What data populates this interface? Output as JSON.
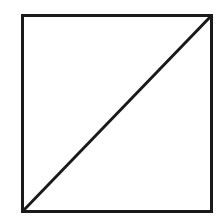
{
  "diagram": {
    "background": "#ffffff",
    "stroke_color": "#1a1a1a",
    "stroke_width": 3,
    "square": {
      "x": 22.5,
      "y": 15.5,
      "width": 189,
      "height": 196
    },
    "diagonal": {
      "x1": 23,
      "y1": 211,
      "x2": 211,
      "y2": 16
    }
  }
}
